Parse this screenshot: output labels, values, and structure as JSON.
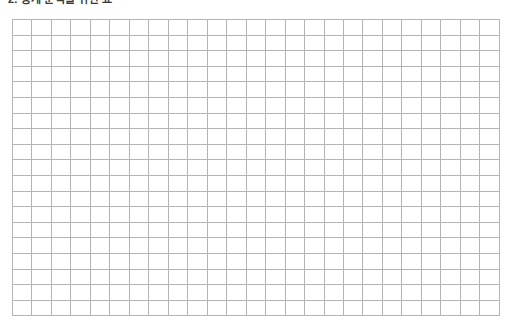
{
  "page": {
    "background_color": "#ffffff",
    "width": 512,
    "height": 330
  },
  "heading": {
    "text": "2. 통계 분석을 위한 표",
    "color": "#3a3a3a",
    "clipped_at_top": true
  },
  "grid": {
    "columns": 25,
    "rows": 19,
    "line_color": "#b4b4b4",
    "cell_background": "#ffffff",
    "empty": true,
    "column_headers": [],
    "rows_data": []
  }
}
